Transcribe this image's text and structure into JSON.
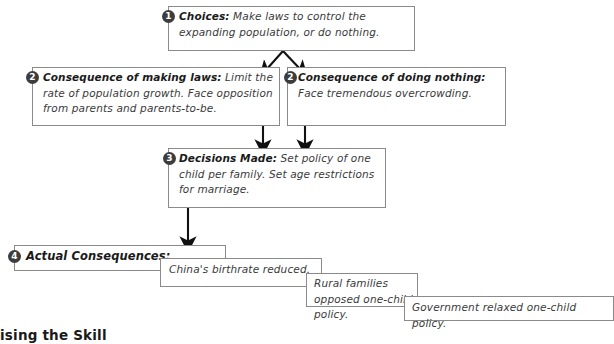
{
  "diagram": {
    "line_color": "#8a8a8a",
    "arrow_color": "#111111",
    "marker_color": "#3d3d3d",
    "background": "#ffffff",
    "nodes": [
      {
        "id": "choices",
        "marker": "1",
        "label": "Choices:",
        "body": " Make laws to control the expanding population, or do nothing."
      },
      {
        "id": "consequence-making-laws",
        "marker": "2",
        "label": "Consequence of making laws:",
        "body": " Limit the rate of population growth. Face opposition from parents and parents-to-be."
      },
      {
        "id": "consequence-doing-nothing",
        "marker": "2",
        "label": "Consequence of doing nothing:",
        "body": " Face tremendous overcrowding."
      },
      {
        "id": "decisions-made",
        "marker": "3",
        "label": "Decisions Made:",
        "body": " Set policy of one child per family. Set age restrictions for marriage."
      },
      {
        "id": "actual-consequences",
        "marker": "4",
        "label": "Actual Consequences:",
        "body": ""
      },
      {
        "id": "outcome-birthrate",
        "marker": "",
        "label": "",
        "body": "China's birthrate reduced."
      },
      {
        "id": "outcome-rural-opposition",
        "marker": "",
        "label": "",
        "body": "Rural families opposed one-child policy."
      },
      {
        "id": "outcome-relaxed-policy",
        "marker": "",
        "label": "",
        "body": "Government relaxed one-child policy."
      }
    ]
  },
  "footer": {
    "heading": "ising the Skill"
  }
}
